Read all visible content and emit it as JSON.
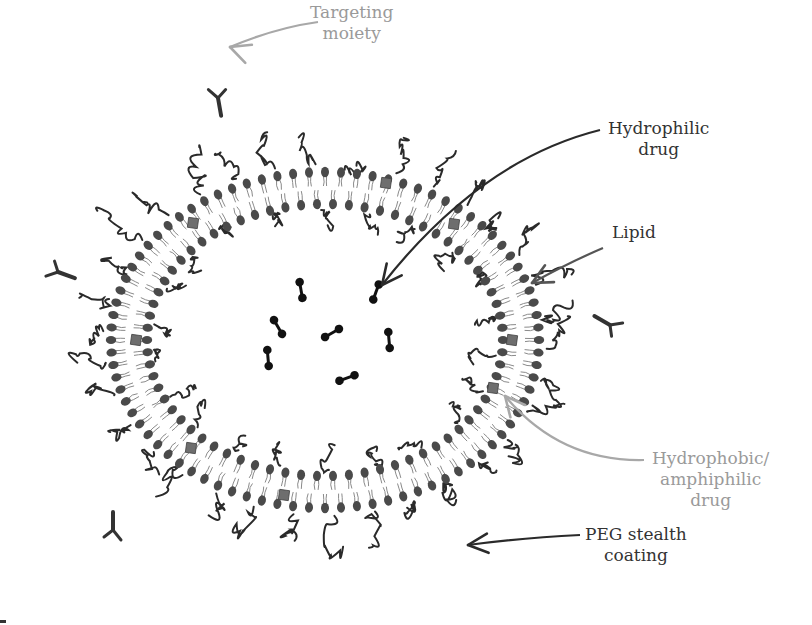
{
  "figure": {
    "center": {
      "x": 325,
      "y": 340
    },
    "outer_leaflet": {
      "rx": 214,
      "ry": 168,
      "count": 84
    },
    "inner_leaflet": {
      "rx": 178,
      "ry": 136,
      "count": 70
    },
    "colors": {
      "lipid_head": "#4a4a4a",
      "lipid_tail": "#8a8a8a",
      "peg": "#2a2a2a",
      "drug": "#111111",
      "hydrophobic_drug": "#6e6e6e",
      "dark_label": "#333333",
      "gray_label": "#9a9a9a",
      "dark_arrow": "#2a2a2a",
      "gray_arrow": "#a8a8a8",
      "lipid_arrow": "#555555"
    }
  },
  "labels": {
    "targeting_moiety": {
      "lines": [
        "Targeting",
        "moiety"
      ],
      "x": 310,
      "y": 2,
      "tone": "gray"
    },
    "hydrophilic_drug": {
      "lines": [
        "Hydrophilic",
        "drug"
      ],
      "x": 608,
      "y": 118,
      "tone": "dark"
    },
    "lipid": {
      "lines": [
        "Lipid"
      ],
      "x": 612,
      "y": 222,
      "tone": "dark"
    },
    "hydrophobic_drug": {
      "lines": [
        "Hydrophobic/",
        "amphiphilic",
        "drug"
      ],
      "x": 652,
      "y": 448,
      "tone": "gray"
    },
    "peg_coating": {
      "lines": [
        "PEG stealth",
        "coating"
      ],
      "x": 585,
      "y": 524,
      "tone": "dark"
    }
  },
  "arrows": [
    {
      "name": "targeting-arrow",
      "d": "M 318 22 Q 275 28 230 47",
      "head": [
        230,
        47
      ],
      "dir": 200,
      "tone": "gray"
    },
    {
      "name": "hydrophilic-arrow",
      "d": "M 600 130 Q 480 160 382 285",
      "head": [
        382,
        285
      ],
      "dir": 128,
      "tone": "dark"
    },
    {
      "name": "lipid-arrow",
      "d": "M 603 248 Q 570 262 532 283",
      "head": [
        532,
        283
      ],
      "dir": 152,
      "tone": "lipid"
    },
    {
      "name": "hydrophobic-arrow",
      "d": "M 644 460 Q 560 462 505 396",
      "head": [
        505,
        396
      ],
      "dir": 230,
      "tone": "gray"
    },
    {
      "name": "peg-arrow",
      "d": "M 580 535 Q 520 538 468 545",
      "head": [
        468,
        545
      ],
      "dir": 175,
      "tone": "dark"
    }
  ],
  "drugs": [
    {
      "x": 301,
      "y": 290,
      "angle": 80
    },
    {
      "x": 278,
      "y": 327,
      "angle": 60
    },
    {
      "x": 332,
      "y": 333,
      "angle": -30
    },
    {
      "x": 376,
      "y": 292,
      "angle": 110
    },
    {
      "x": 389,
      "y": 340,
      "angle": 85
    },
    {
      "x": 268,
      "y": 358,
      "angle": 85
    },
    {
      "x": 347,
      "y": 378,
      "angle": -20
    }
  ],
  "hydrophobic_drugs": [
    {
      "x": 386,
      "y": 183
    },
    {
      "x": 454,
      "y": 224
    },
    {
      "x": 193,
      "y": 223
    },
    {
      "x": 136,
      "y": 340
    },
    {
      "x": 512,
      "y": 340
    },
    {
      "x": 493,
      "y": 388
    },
    {
      "x": 191,
      "y": 448
    },
    {
      "x": 284,
      "y": 495
    }
  ],
  "targeting_ligands": [
    {
      "x": 218,
      "y": 98,
      "angle": -10
    },
    {
      "x": 58,
      "y": 272,
      "angle": -70
    },
    {
      "x": 610,
      "y": 325,
      "angle": 120
    },
    {
      "x": 113,
      "y": 530,
      "angle": 180
    }
  ]
}
